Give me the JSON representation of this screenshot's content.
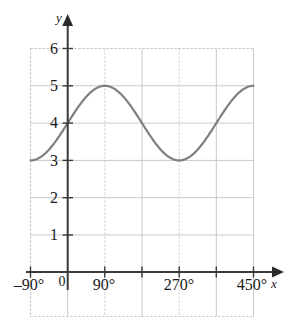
{
  "chart_data": {
    "type": "line",
    "title": "",
    "subtitle": "",
    "xlabel": "x",
    "ylabel": "y",
    "function": "y = 4 + sin(x)",
    "grid": true,
    "legend": false,
    "legend_position": "none",
    "xlim": [
      -90,
      450
    ],
    "ylim": [
      0,
      6.6
    ],
    "x_unit": "degrees",
    "x_tick_values": [
      -90,
      0,
      90,
      180,
      270,
      360,
      450
    ],
    "x_tick_labels": [
      "–90°",
      "0",
      "90°",
      "",
      "270°",
      "",
      "450°"
    ],
    "x_gridlines": [
      -90,
      0,
      90,
      180,
      270,
      360,
      450
    ],
    "y_tick_values": [
      1,
      2,
      3,
      4,
      5,
      6
    ],
    "y_tick_labels": [
      "1",
      "2",
      "3",
      "4",
      "5",
      "6"
    ],
    "y_gridlines": [
      1,
      2,
      3,
      4,
      5,
      6
    ],
    "series": [
      {
        "name": "y = 4 + sin(x)",
        "color": "#7f7f7f",
        "line_width": 2.2,
        "amplitude": 1,
        "midline": 4,
        "period": 360,
        "phase": 0,
        "key_points": [
          {
            "x": -90,
            "y": 3
          },
          {
            "x": 0,
            "y": 4
          },
          {
            "x": 90,
            "y": 5
          },
          {
            "x": 180,
            "y": 4
          },
          {
            "x": 270,
            "y": 3
          },
          {
            "x": 360,
            "y": 4
          },
          {
            "x": 450,
            "y": 5
          }
        ]
      }
    ],
    "colors": {
      "curve": "#7f7f7f",
      "axis": "#3a3a3a",
      "gridline": "#c9c9c9",
      "gridline_dotted": "#cfcfcf",
      "plot_border": "#bdbdbd",
      "text": "#1a1a1a",
      "background": "#ffffff"
    }
  },
  "labels": {
    "y_axis": "y",
    "x_axis": "x",
    "origin": "0",
    "x_ticks": {
      "neg90": "–90°",
      "t90": "90°",
      "t270": "270°",
      "t450": "450°"
    },
    "y_ticks": {
      "y1": "1",
      "y2": "2",
      "y3": "3",
      "y4": "4",
      "y5": "5",
      "y6": "6"
    }
  }
}
